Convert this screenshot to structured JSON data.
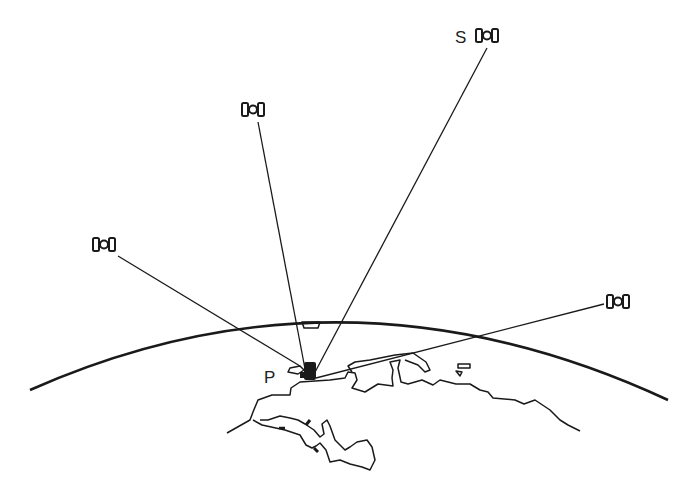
{
  "diagram": {
    "labels": {
      "satellite": "S",
      "point": "P"
    },
    "colors": {
      "ink": "#1a1a1a",
      "background": "#ffffff"
    },
    "satellites": [
      {
        "id": "sat-left",
        "x": 103,
        "y": 245
      },
      {
        "id": "sat-upper-left",
        "x": 253,
        "y": 110
      },
      {
        "id": "sat-s",
        "x": 490,
        "y": 37
      },
      {
        "id": "sat-right",
        "x": 620,
        "y": 302
      }
    ],
    "receiver": {
      "x": 312,
      "y": 378
    }
  }
}
